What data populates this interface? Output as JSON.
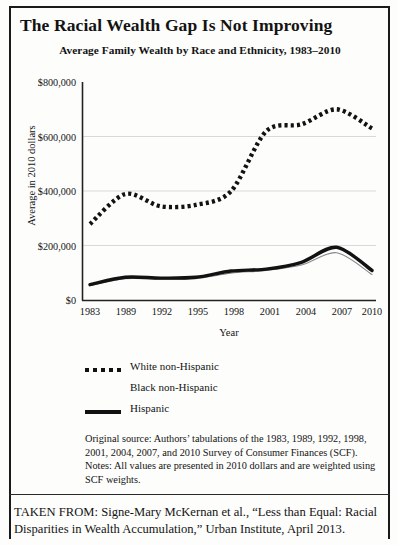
{
  "title": "The Racial Wealth Gap Is Not Improving",
  "subtitle": "Average Family Wealth by Race and Ethnicity, 1983–2010",
  "legend": {
    "items": [
      {
        "label": "White non-Hispanic",
        "key": "dotted",
        "color": "#111111"
      },
      {
        "label": "Black non-Hispanic",
        "key": "faint",
        "color": "#8a8a8a"
      },
      {
        "label": "Hispanic",
        "key": "solid",
        "color": "#111111"
      }
    ]
  },
  "notes": "Original source: Authors’ tabulations of the 1983, 1989, 1992, 1998, 2001, 2004, 2007, and 2010 Survey of Consumer Finances (SCF). Notes: All values are presented in 2010 dollars and are weighted using SCF weights.",
  "taken_from": "TAKEN FROM: Signe-Mary McKernan et al., “Less than Equal: Racial Disparities in Wealth Accumulation,” Urban Institute, April 2013.",
  "chart_data": {
    "type": "line",
    "title": "Average Family Wealth by Race and Ethnicity, 1983–2010",
    "xlabel": "Year",
    "ylabel": "Average in 2010 dollars",
    "ylim": [
      0,
      800000
    ],
    "yticks": [
      0,
      200000,
      400000,
      600000,
      800000
    ],
    "ytick_labels": [
      "$0",
      "$200,000",
      "$400,000",
      "$600,000",
      "$800,000"
    ],
    "categories": [
      "1983",
      "1989",
      "1992",
      "1995",
      "1998",
      "2001",
      "2004",
      "2007",
      "2010"
    ],
    "xtick_labels": [
      "1983",
      "1989",
      "1992",
      "1995",
      "1998",
      "2001",
      "2004",
      "2007",
      "2010"
    ],
    "grid": "horizontal",
    "legend_position": "below",
    "series": [
      {
        "name": "White non-Hispanic",
        "style": "dotted",
        "color": "#111111",
        "values": [
          280000,
          390000,
          345000,
          350000,
          400000,
          620000,
          645000,
          700000,
          630000
        ]
      },
      {
        "name": "Black non-Hispanic",
        "style": "thin",
        "color": "#8a8a8a",
        "values": [
          55000,
          80000,
          78000,
          80000,
          100000,
          110000,
          130000,
          175000,
          95000
        ]
      },
      {
        "name": "Hispanic",
        "style": "solid",
        "color": "#111111",
        "values": [
          58000,
          85000,
          82000,
          85000,
          108000,
          115000,
          140000,
          195000,
          110000
        ]
      }
    ]
  }
}
